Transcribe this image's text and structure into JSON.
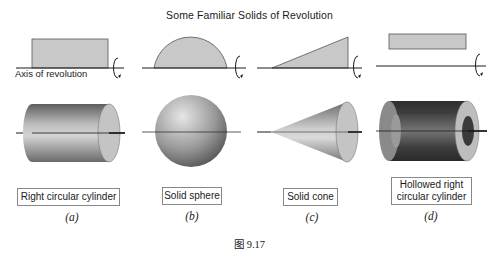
{
  "figure": {
    "title": "Some Familiar Solids of Revolution",
    "axis_label": "Axis of revolution",
    "caption": "图 9.17",
    "panels": [
      {
        "id": "a",
        "label": "Right circular cylinder",
        "sub": "(a)",
        "profile": "rectangle on axis"
      },
      {
        "id": "b",
        "label": "Solid sphere",
        "sub": "(b)",
        "profile": "semicircle on axis"
      },
      {
        "id": "c",
        "label": "Solid cone",
        "sub": "(c)",
        "profile": "right triangle on axis"
      },
      {
        "id": "d",
        "label": "Hollowed right circular cylinder",
        "label_line1": "Hollowed right",
        "label_line2": "circular cylinder",
        "sub": "(d)",
        "profile": "rectangle above axis"
      }
    ],
    "colors": {
      "profile_fill": "#c8c8c8",
      "profile_stroke": "#555555",
      "axis": "#1a1a1a",
      "solid_light": "#d9d9d9",
      "solid_dark": "#6e6e6e",
      "hollow_dark": "#3a3a3a"
    }
  }
}
